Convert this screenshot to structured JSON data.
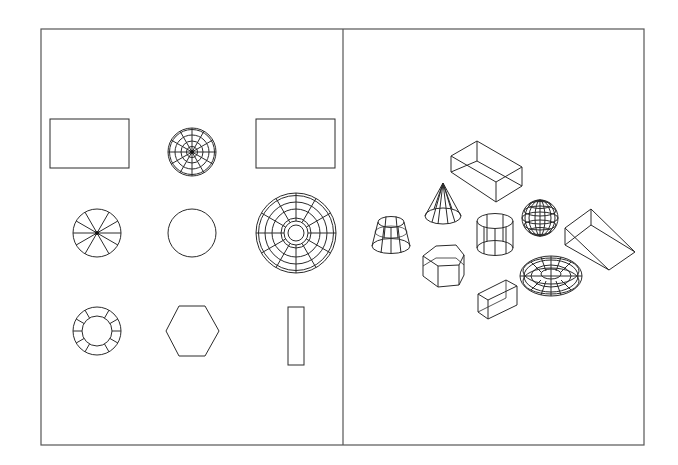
{
  "diagram": {
    "title": "",
    "colors": {
      "background": "#ffffff",
      "stroke": "#2a2a2a",
      "frame": "#555555"
    },
    "frame": {
      "x": 41,
      "y": 29,
      "width": 603,
      "height": 416,
      "divider_x": 343
    },
    "panels": [
      {
        "id": "plan-view",
        "label": "",
        "shapes": [
          {
            "name": "box-top-view",
            "type": "rectangle",
            "row": 1,
            "col": 1
          },
          {
            "name": "sphere-top-view",
            "type": "sphere-mesh",
            "row": 1,
            "col": 2
          },
          {
            "name": "wedge-top-view",
            "type": "rectangle",
            "row": 1,
            "col": 3
          },
          {
            "name": "cone-top-view",
            "type": "radial-segments",
            "row": 2,
            "col": 1
          },
          {
            "name": "cylinder-top-view",
            "type": "circle",
            "row": 2,
            "col": 2
          },
          {
            "name": "torus-top-view",
            "type": "torus-mesh",
            "row": 2,
            "col": 3
          },
          {
            "name": "truncated-cone-top-view",
            "type": "ring-segments",
            "row": 3,
            "col": 1
          },
          {
            "name": "hexagonal-prism-top-view",
            "type": "hexagon",
            "row": 3,
            "col": 2
          },
          {
            "name": "small-box-top-view",
            "type": "rectangle",
            "row": 3,
            "col": 3
          }
        ]
      },
      {
        "id": "isometric-view",
        "label": "",
        "shapes": [
          {
            "name": "box-isometric",
            "type": "box"
          },
          {
            "name": "cone-isometric",
            "type": "cone"
          },
          {
            "name": "truncated-cone-isometric",
            "type": "frustum"
          },
          {
            "name": "cylinder-isometric",
            "type": "cylinder"
          },
          {
            "name": "sphere-isometric",
            "type": "sphere"
          },
          {
            "name": "wedge-isometric",
            "type": "wedge"
          },
          {
            "name": "hexagonal-prism-isometric",
            "type": "hex-prism"
          },
          {
            "name": "torus-isometric",
            "type": "torus"
          },
          {
            "name": "small-box-isometric",
            "type": "box"
          }
        ]
      }
    ]
  }
}
